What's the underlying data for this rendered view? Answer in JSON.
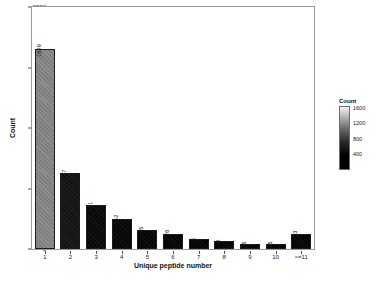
{
  "chart_data": {
    "type": "bar",
    "title": "",
    "xlabel": "Unique peptide number",
    "ylabel": "Count",
    "categories": [
      "1",
      "2",
      "3",
      "4",
      "5",
      "6",
      "7",
      "8",
      "9",
      "10",
      ">=11"
    ],
    "values": [
      1649,
      627,
      361,
      252,
      155,
      126,
      81,
      64,
      45,
      45,
      123
    ],
    "value_labels": [
      "1649",
      "627",
      "361",
      "252",
      "155",
      "126",
      "81",
      "64",
      "45",
      "45",
      "123"
    ],
    "ylim": [
      0,
      2000
    ],
    "y_ticks": [
      0,
      500,
      1000,
      1500,
      2000
    ],
    "y_tick_labels": [
      "0",
      "500",
      "1000",
      "1500",
      "2000"
    ],
    "x_tick_labels": [
      "1",
      "2",
      "3",
      "4",
      "5",
      "6",
      "7",
      "8",
      "9",
      "10",
      ">=11"
    ],
    "grid": false,
    "legend": {
      "title": "Count",
      "position": "right",
      "type": "continuous-colorbar",
      "ticks": [
        1600,
        1200,
        800,
        400
      ],
      "tick_labels": [
        "1600",
        "1200",
        "800",
        "400"
      ],
      "range": [
        0,
        1649
      ],
      "low_color": "#000000",
      "high_color": "#f2f2f2"
    },
    "bar_colors": [
      "#808080",
      "#141414",
      "#090909",
      "#070707",
      "#050505",
      "#050505",
      "#040404",
      "#040404",
      "#030303",
      "#030303",
      "#050505"
    ],
    "panel_border_color": "#9a9a9a",
    "bar_outline_color": "#1b1b1b",
    "background": "#ffffff"
  }
}
